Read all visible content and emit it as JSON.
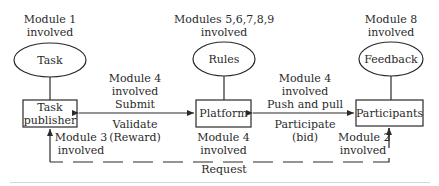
{
  "diagram": {
    "nodes": {
      "task": {
        "label": "Task",
        "shape": "ellipse",
        "module_note": [
          "Module 1",
          "involved"
        ]
      },
      "rules": {
        "label": "Rules",
        "shape": "ellipse",
        "module_note": [
          "Modules 5,6,7,8,9",
          "involved"
        ]
      },
      "feedback": {
        "label": "Feedback",
        "shape": "ellipse",
        "module_note": [
          "Module 8",
          "involved"
        ]
      },
      "task_publisher": {
        "label": [
          "Task",
          "publisher"
        ],
        "shape": "box",
        "module_note": [
          "Module 3",
          "involved"
        ]
      },
      "platform": {
        "label": "Platform",
        "shape": "box",
        "module_note": [
          "Module 4",
          "involved"
        ]
      },
      "participants": {
        "label": "Participants",
        "shape": "box",
        "module_note": [
          "Module 2",
          "involved"
        ]
      }
    },
    "edges": {
      "publisher_platform": {
        "above": [
          "Module 4",
          "involved",
          "Submit"
        ],
        "below": [
          "Validate",
          "(Reward)"
        ],
        "direction": "bidirectional"
      },
      "platform_participants": {
        "above": [
          "Module 4",
          "involved",
          "Push and pull"
        ],
        "below": [
          "Participate",
          "(bid)"
        ],
        "direction": "bidirectional"
      },
      "request": {
        "label": "Request",
        "style": "dashed",
        "from": "participants",
        "to": "task_publisher"
      }
    },
    "colors": {
      "stroke": "#2a2a2a",
      "background": "#ffffff"
    }
  }
}
